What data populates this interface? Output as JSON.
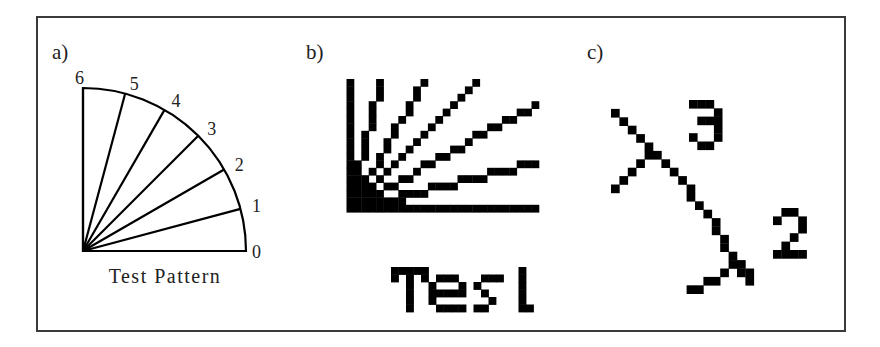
{
  "panels": {
    "a": {
      "label": "a)",
      "caption": "Test Pattern",
      "center": [
        83,
        251
      ],
      "radius": 163,
      "angles_deg": [
        0,
        15,
        30,
        45,
        60,
        75,
        90
      ],
      "tick_labels": [
        "0",
        "1",
        "2",
        "3",
        "4",
        "5",
        "6"
      ]
    },
    "b": {
      "label": "b)",
      "grid_origin": [
        346.5,
        79
      ],
      "cell": 7.4,
      "cols": 26,
      "rows": 18,
      "lines": [
        {
          "id": "6",
          "end": [
            0,
            0
          ]
        },
        {
          "id": "5",
          "end": [
            4,
            0
          ]
        },
        {
          "id": "4",
          "end": [
            10,
            0
          ]
        },
        {
          "id": "3",
          "end": [
            17,
            0
          ]
        },
        {
          "id": "2",
          "end": [
            25,
            3
          ]
        },
        {
          "id": "1",
          "end": [
            25,
            11
          ]
        },
        {
          "id": "0",
          "end": [
            25,
            17
          ]
        }
      ],
      "text": "Test",
      "text_origin": [
        391,
        267
      ],
      "text_cell": 7.5,
      "text_pixels": [
        [
          0,
          0
        ],
        [
          1,
          0
        ],
        [
          2,
          0
        ],
        [
          3,
          0
        ],
        [
          4,
          0
        ],
        [
          0,
          1
        ],
        [
          4,
          1
        ],
        [
          2,
          1
        ],
        [
          2,
          2
        ],
        [
          2,
          3
        ],
        [
          2,
          4
        ],
        [
          2,
          5
        ],
        [
          6,
          1
        ],
        [
          7,
          1
        ],
        [
          8,
          1
        ],
        [
          5,
          2
        ],
        [
          9,
          2
        ],
        [
          5,
          3
        ],
        [
          6,
          3
        ],
        [
          7,
          3
        ],
        [
          8,
          3
        ],
        [
          9,
          3
        ],
        [
          5,
          4
        ],
        [
          6,
          5
        ],
        [
          7,
          5
        ],
        [
          8,
          5
        ],
        [
          9,
          5
        ],
        [
          12,
          1
        ],
        [
          13,
          1
        ],
        [
          14,
          1
        ],
        [
          11,
          2
        ],
        [
          12,
          3
        ],
        [
          13,
          4
        ],
        [
          11,
          5
        ],
        [
          12,
          5
        ],
        [
          17,
          0
        ],
        [
          17,
          1
        ],
        [
          17,
          2
        ],
        [
          17,
          3
        ],
        [
          17,
          4
        ],
        [
          17,
          5
        ],
        [
          18,
          5
        ]
      ]
    },
    "c": {
      "label": "c)",
      "grid_origin": [
        611,
        100.5
      ],
      "cell": 8.4,
      "line_pixels": [
        [
          0,
          1
        ],
        [
          1,
          2
        ],
        [
          2,
          3
        ],
        [
          3,
          4
        ],
        [
          4,
          5
        ],
        [
          4,
          6
        ],
        [
          5,
          6
        ],
        [
          6,
          7
        ],
        [
          7,
          8
        ],
        [
          8,
          9
        ],
        [
          9,
          10
        ],
        [
          9,
          11
        ],
        [
          10,
          12
        ],
        [
          11,
          13
        ],
        [
          12,
          14
        ],
        [
          12,
          15
        ],
        [
          13,
          16
        ],
        [
          13,
          17
        ],
        [
          14,
          18
        ],
        [
          14,
          19
        ],
        [
          15,
          19
        ],
        [
          15,
          20
        ],
        [
          16,
          20
        ],
        [
          16,
          21
        ],
        [
          3,
          7
        ],
        [
          2,
          8
        ],
        [
          1,
          9
        ],
        [
          0,
          10
        ],
        [
          13,
          20
        ],
        [
          11,
          21
        ],
        [
          12,
          21
        ],
        [
          9,
          22
        ],
        [
          10,
          22
        ]
      ],
      "digits": [
        {
          "text": "3",
          "origin": [
            689,
            100
          ],
          "cell": 8.3,
          "pixels": [
            [
              0,
              0
            ],
            [
              1,
              0
            ],
            [
              2,
              0
            ],
            [
              3,
              1
            ],
            [
              1,
              2
            ],
            [
              2,
              2
            ],
            [
              3,
              2
            ],
            [
              3,
              3
            ],
            [
              0,
              4
            ],
            [
              3,
              4
            ],
            [
              1,
              5
            ],
            [
              2,
              5
            ]
          ]
        },
        {
          "text": "2",
          "origin": [
            773,
            208
          ],
          "cell": 8.4,
          "pixels": [
            [
              1,
              0
            ],
            [
              2,
              0
            ],
            [
              0,
              1
            ],
            [
              3,
              1
            ],
            [
              3,
              2
            ],
            [
              2,
              3
            ],
            [
              1,
              4
            ],
            [
              0,
              5
            ],
            [
              1,
              5
            ],
            [
              2,
              5
            ],
            [
              3,
              5
            ]
          ]
        }
      ]
    }
  },
  "colors": {
    "ink": "#000000",
    "frame": "#3a3a3a",
    "text": "#222222"
  }
}
